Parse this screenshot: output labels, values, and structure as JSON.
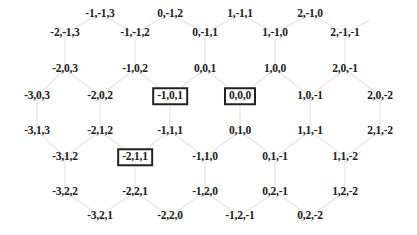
{
  "diagram": {
    "type": "hexagonal-grid-cube-coordinates",
    "line_color": "#e6e6e6",
    "text_color": "#222222",
    "nodes": [
      {
        "label": "-1,-1,3",
        "x": 100,
        "y": 14
      },
      {
        "label": "0,-1,2",
        "x": 170,
        "y": 14
      },
      {
        "label": "1,-1,1",
        "x": 240,
        "y": 14
      },
      {
        "label": "2,-1,0",
        "x": 310,
        "y": 14
      },
      {
        "label": "-2,-1,3",
        "x": 65,
        "y": 33
      },
      {
        "label": "-1,-1,2",
        "x": 135,
        "y": 33
      },
      {
        "label": "0,-1,1",
        "x": 205,
        "y": 33
      },
      {
        "label": "1,-1,0",
        "x": 275,
        "y": 33
      },
      {
        "label": "2,-1,-1",
        "x": 345,
        "y": 33
      },
      {
        "label": "-2,0,3",
        "x": 65,
        "y": 69
      },
      {
        "label": "-1,0,2",
        "x": 135,
        "y": 69
      },
      {
        "label": "0,0,1",
        "x": 205,
        "y": 69
      },
      {
        "label": "1,0,0",
        "x": 275,
        "y": 69
      },
      {
        "label": "2,0,-1",
        "x": 345,
        "y": 69
      },
      {
        "label": "-3,0,3",
        "x": 37,
        "y": 96
      },
      {
        "label": "-2,0,2",
        "x": 100,
        "y": 96
      },
      {
        "label": "-1,0,1",
        "x": 170,
        "y": 96,
        "boxed": true
      },
      {
        "label": "0,0,0",
        "x": 240,
        "y": 96,
        "boxed": true
      },
      {
        "label": "1,0,-1",
        "x": 310,
        "y": 96
      },
      {
        "label": "2,0,-2",
        "x": 380,
        "y": 96
      },
      {
        "label": "-3,1,3",
        "x": 37,
        "y": 131
      },
      {
        "label": "-2,1,2",
        "x": 100,
        "y": 131
      },
      {
        "label": "-1,1,1",
        "x": 170,
        "y": 131
      },
      {
        "label": "0,1,0",
        "x": 240,
        "y": 131
      },
      {
        "label": "1,1,-1",
        "x": 310,
        "y": 131
      },
      {
        "label": "2,1,-2",
        "x": 380,
        "y": 131
      },
      {
        "label": "-3,1,2",
        "x": 65,
        "y": 157
      },
      {
        "label": "-2,1,1",
        "x": 135,
        "y": 157,
        "boxed": true
      },
      {
        "label": "-1,1,0",
        "x": 205,
        "y": 157
      },
      {
        "label": "0,1,-1",
        "x": 275,
        "y": 157
      },
      {
        "label": "1,1,-2",
        "x": 345,
        "y": 157
      },
      {
        "label": "-3,2,2",
        "x": 65,
        "y": 192
      },
      {
        "label": "-2,2,1",
        "x": 135,
        "y": 192
      },
      {
        "label": "-1,2,0",
        "x": 205,
        "y": 192
      },
      {
        "label": "0,2,-1",
        "x": 275,
        "y": 192
      },
      {
        "label": "1,2,-2",
        "x": 345,
        "y": 192
      },
      {
        "label": "-3,2,1",
        "x": 100,
        "y": 216
      },
      {
        "label": "-2,2,0",
        "x": 170,
        "y": 216
      },
      {
        "label": "-1,2,-1",
        "x": 240,
        "y": 216
      },
      {
        "label": "0,2,-2",
        "x": 310,
        "y": 216
      }
    ],
    "highlighted": [
      "-1,0,1",
      "0,0,0",
      "-2,1,1"
    ]
  }
}
